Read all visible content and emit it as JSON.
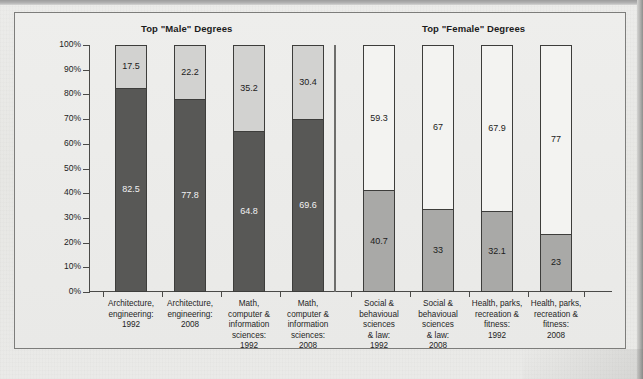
{
  "chart_data": {
    "type": "bar",
    "subtype": "stacked-100-percent",
    "title": "",
    "groups": [
      {
        "name": "Top \"Male\" Degrees"
      },
      {
        "name": "Top \"Female\" Degrees"
      }
    ],
    "categories": [
      "Architecture,\nengineering:\n1992",
      "Architecture,\nengineering:\n2008",
      "Math,\ncomputer &\ninformation\nsciences:\n1992",
      "Math,\ncomputer &\ninformation\nsciences:\n2008",
      "Social &\nbehavioual\nsciences\n& law:\n1992",
      "Social &\nbehavioual\nsciences\n& law:\n2008",
      "Health, parks,\nrecreation &\nfitness:\n1992",
      "Health, parks,\nrecreation &\nfitness:\n2008"
    ],
    "series": [
      {
        "name": "Lower segment",
        "values": [
          82.5,
          77.8,
          64.8,
          69.6,
          40.7,
          33,
          32.1,
          23
        ]
      },
      {
        "name": "Upper segment",
        "values": [
          17.5,
          22.2,
          35.2,
          30.4,
          59.3,
          67,
          67.9,
          77
        ]
      }
    ],
    "bars": [
      {
        "group": 0,
        "category": "Architecture,\nengineering:\n1992",
        "lower": 82.5,
        "upper": 17.5,
        "lower_label": "82.5",
        "upper_label": "17.5"
      },
      {
        "group": 0,
        "category": "Architecture,\nengineering:\n2008",
        "lower": 77.8,
        "upper": 22.2,
        "lower_label": "77.8",
        "upper_label": "22.2"
      },
      {
        "group": 0,
        "category": "Math,\ncomputer &\ninformation\nsciences:\n1992",
        "lower": 64.8,
        "upper": 35.2,
        "lower_label": "64.8",
        "upper_label": "35.2"
      },
      {
        "group": 0,
        "category": "Math,\ncomputer &\ninformation\nsciences:\n2008",
        "lower": 69.6,
        "upper": 30.4,
        "lower_label": "69.6",
        "upper_label": "30.4"
      },
      {
        "group": 1,
        "category": "Social &\nbehavioual\nsciences\n& law:\n1992",
        "lower": 40.7,
        "upper": 59.3,
        "lower_label": "40.7",
        "upper_label": "59.3"
      },
      {
        "group": 1,
        "category": "Social &\nbehavioual\nsciences\n& law:\n2008",
        "lower": 33,
        "upper": 67,
        "lower_label": "33",
        "upper_label": "67"
      },
      {
        "group": 1,
        "category": "Health, parks,\nrecreation &\nfitness:\n1992",
        "lower": 32.1,
        "upper": 67.9,
        "lower_label": "32.1",
        "upper_label": "67.9"
      },
      {
        "group": 1,
        "category": "Health, parks,\nrecreation &\nfitness:\n2008",
        "lower": 23,
        "upper": 77,
        "lower_label": "23",
        "upper_label": "77"
      }
    ],
    "ylabel": "",
    "xlabel": "",
    "ylim": [
      0,
      100
    ],
    "yticks": [
      "0%",
      "10%",
      "20%",
      "30%",
      "40%",
      "50%",
      "60%",
      "70%",
      "80%",
      "90%",
      "100%"
    ],
    "grid": false,
    "legend": "none",
    "colors": {
      "male_lower": "#585856",
      "male_upper": "#d2d2d0",
      "female_lower": "#a9a9a7",
      "female_upper": "#f3f3f1",
      "bar_border": "#3d3d3b",
      "axis": "#4a4a48",
      "frame": "#7d7d7b",
      "background": "#e9e9e7",
      "text": "#1c1c1c"
    }
  },
  "figure": {
    "group_title_male": "Top \"Male\" Degrees",
    "group_title_female": "Top \"Female\" Degrees",
    "caption": ""
  }
}
